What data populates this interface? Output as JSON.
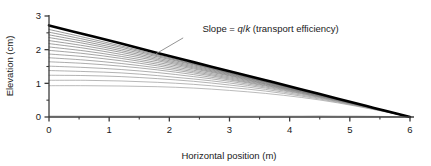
{
  "chart_data": {
    "type": "line",
    "title": "",
    "xlabel": "Horizontal position (m)",
    "ylabel": "Elevation (cm)",
    "xlim": [
      0,
      6
    ],
    "ylim": [
      0,
      3
    ],
    "xticks": [
      0,
      1,
      2,
      3,
      4,
      5,
      6
    ],
    "xticklabels": [
      "0",
      "1",
      "2",
      "3",
      "4",
      "5",
      "6"
    ],
    "yticks": [
      0,
      1,
      2,
      3
    ],
    "yticklabels": [
      "0",
      "1",
      "2",
      "3"
    ],
    "minor_ticks": true,
    "grid": false,
    "legend": "none",
    "annotations": [
      {
        "text_parts": [
          "Slope = ",
          "q",
          "/",
          "k",
          " (transport efficiency)"
        ],
        "italic_parts": [
          false,
          true,
          false,
          true,
          false
        ],
        "text": "Slope = q/k (transport efficiency)",
        "x": 2.55,
        "y": 2.53,
        "leader_from": [
          2.23,
          2.35
        ],
        "leader_to": [
          1.78,
          1.88
        ]
      }
    ],
    "series": [
      {
        "name": "steady-state profile",
        "color": "#000000",
        "linewidth": 2.6,
        "x": [
          0,
          0.6,
          1.2,
          1.8,
          2.4,
          3.0,
          3.6,
          4.2,
          4.8,
          5.4,
          6.0
        ],
        "values": [
          2.72,
          2.45,
          2.18,
          1.9,
          1.63,
          1.36,
          1.09,
          0.82,
          0.54,
          0.27,
          0.0
        ]
      },
      {
        "name": "profile t20",
        "color": "#6e6e6e",
        "linewidth": 0.7,
        "x": [
          0,
          0.6,
          1.2,
          1.8,
          2.4,
          3.0,
          3.6,
          4.2,
          4.8,
          5.4,
          6.0
        ],
        "values": [
          2.6,
          2.36,
          2.11,
          1.85,
          1.59,
          1.33,
          1.07,
          0.81,
          0.54,
          0.27,
          0.0
        ]
      },
      {
        "name": "profile t19",
        "color": "#6e6e6e",
        "linewidth": 0.7,
        "x": [
          0,
          0.6,
          1.2,
          1.8,
          2.4,
          3.0,
          3.6,
          4.2,
          4.8,
          5.4,
          6.0
        ],
        "values": [
          2.52,
          2.3,
          2.07,
          1.82,
          1.57,
          1.31,
          1.06,
          0.8,
          0.53,
          0.27,
          0.0
        ]
      },
      {
        "name": "profile t18",
        "color": "#707070",
        "linewidth": 0.7,
        "x": [
          0,
          0.6,
          1.2,
          1.8,
          2.4,
          3.0,
          3.6,
          4.2,
          4.8,
          5.4,
          6.0
        ],
        "values": [
          2.44,
          2.24,
          2.02,
          1.79,
          1.55,
          1.3,
          1.05,
          0.79,
          0.53,
          0.26,
          0.0
        ]
      },
      {
        "name": "profile t17",
        "color": "#737373",
        "linewidth": 0.7,
        "x": [
          0,
          0.6,
          1.2,
          1.8,
          2.4,
          3.0,
          3.6,
          4.2,
          4.8,
          5.4,
          6.0
        ],
        "values": [
          2.36,
          2.18,
          1.97,
          1.75,
          1.52,
          1.28,
          1.04,
          0.79,
          0.53,
          0.26,
          0.0
        ]
      },
      {
        "name": "profile t16",
        "color": "#757575",
        "linewidth": 0.7,
        "x": [
          0,
          0.6,
          1.2,
          1.8,
          2.4,
          3.0,
          3.6,
          4.2,
          4.8,
          5.4,
          6.0
        ],
        "values": [
          2.27,
          2.11,
          1.92,
          1.71,
          1.49,
          1.26,
          1.03,
          0.78,
          0.52,
          0.26,
          0.0
        ]
      },
      {
        "name": "profile t15",
        "color": "#787878",
        "linewidth": 0.7,
        "x": [
          0,
          0.6,
          1.2,
          1.8,
          2.4,
          3.0,
          3.6,
          4.2,
          4.8,
          5.4,
          6.0
        ],
        "values": [
          2.18,
          2.04,
          1.86,
          1.67,
          1.46,
          1.24,
          1.01,
          0.77,
          0.52,
          0.26,
          0.0
        ]
      },
      {
        "name": "profile t14",
        "color": "#7b7b7b",
        "linewidth": 0.7,
        "x": [
          0,
          0.6,
          1.2,
          1.8,
          2.4,
          3.0,
          3.6,
          4.2,
          4.8,
          5.4,
          6.0
        ],
        "values": [
          2.08,
          1.96,
          1.8,
          1.62,
          1.43,
          1.22,
          0.99,
          0.76,
          0.51,
          0.26,
          0.0
        ]
      },
      {
        "name": "profile t13",
        "color": "#7e7e7e",
        "linewidth": 0.7,
        "x": [
          0,
          0.6,
          1.2,
          1.8,
          2.4,
          3.0,
          3.6,
          4.2,
          4.8,
          5.4,
          6.0
        ],
        "values": [
          1.98,
          1.88,
          1.74,
          1.57,
          1.39,
          1.19,
          0.98,
          0.75,
          0.51,
          0.26,
          0.0
        ]
      },
      {
        "name": "profile t12",
        "color": "#818181",
        "linewidth": 0.7,
        "x": [
          0,
          0.6,
          1.2,
          1.8,
          2.4,
          3.0,
          3.6,
          4.2,
          4.8,
          5.4,
          6.0
        ],
        "values": [
          1.87,
          1.79,
          1.67,
          1.52,
          1.35,
          1.16,
          0.96,
          0.74,
          0.5,
          0.26,
          0.0
        ]
      },
      {
        "name": "profile t11",
        "color": "#858585",
        "linewidth": 0.7,
        "x": [
          0,
          0.6,
          1.2,
          1.8,
          2.4,
          3.0,
          3.6,
          4.2,
          4.8,
          5.4,
          6.0
        ],
        "values": [
          1.76,
          1.69,
          1.59,
          1.46,
          1.31,
          1.13,
          0.94,
          0.73,
          0.5,
          0.25,
          0.0
        ]
      },
      {
        "name": "profile t10",
        "color": "#888888",
        "linewidth": 0.7,
        "x": [
          0,
          0.6,
          1.2,
          1.8,
          2.4,
          3.0,
          3.6,
          4.2,
          4.8,
          5.4,
          6.0
        ],
        "values": [
          1.64,
          1.59,
          1.51,
          1.4,
          1.26,
          1.1,
          0.92,
          0.71,
          0.49,
          0.25,
          0.0
        ]
      },
      {
        "name": "profile t9",
        "color": "#8c8c8c",
        "linewidth": 0.7,
        "x": [
          0,
          0.6,
          1.2,
          1.8,
          2.4,
          3.0,
          3.6,
          4.2,
          4.8,
          5.4,
          6.0
        ],
        "values": [
          1.51,
          1.47,
          1.41,
          1.32,
          1.2,
          1.06,
          0.89,
          0.7,
          0.48,
          0.25,
          0.0
        ]
      },
      {
        "name": "profile t8",
        "color": "#909090",
        "linewidth": 0.7,
        "x": [
          0,
          0.6,
          1.2,
          1.8,
          2.4,
          3.0,
          3.6,
          4.2,
          4.8,
          5.4,
          6.0
        ],
        "values": [
          1.38,
          1.35,
          1.31,
          1.23,
          1.13,
          1.01,
          0.86,
          0.68,
          0.47,
          0.24,
          0.0
        ]
      },
      {
        "name": "profile t7",
        "color": "#949494",
        "linewidth": 0.7,
        "x": [
          0,
          0.6,
          1.2,
          1.8,
          2.4,
          3.0,
          3.6,
          4.2,
          4.8,
          5.4,
          6.0
        ],
        "values": [
          1.24,
          1.23,
          1.2,
          1.14,
          1.06,
          0.95,
          0.82,
          0.65,
          0.46,
          0.24,
          0.0
        ]
      },
      {
        "name": "profile t6",
        "color": "#989898",
        "linewidth": 0.7,
        "x": [
          0,
          0.6,
          1.2,
          1.8,
          2.4,
          3.0,
          3.6,
          4.2,
          4.8,
          5.4,
          6.0
        ],
        "values": [
          1.09,
          1.09,
          1.07,
          1.03,
          0.97,
          0.88,
          0.77,
          0.62,
          0.44,
          0.23,
          0.0
        ]
      },
      {
        "name": "profile t5",
        "color": "#9d9d9d",
        "linewidth": 0.7,
        "x": [
          0,
          0.6,
          1.2,
          1.8,
          2.4,
          3.0,
          3.6,
          4.2,
          4.8,
          5.4,
          6.0
        ],
        "values": [
          0.93,
          0.93,
          0.92,
          0.9,
          0.86,
          0.79,
          0.7,
          0.58,
          0.42,
          0.22,
          0.0
        ]
      },
      {
        "name": "initial flat profile",
        "color": "#c4c4c4",
        "linewidth": 1.2,
        "x": [
          0,
          0.6,
          1.2,
          1.8,
          2.4,
          3.0,
          3.6,
          4.2,
          4.8,
          5.4,
          6.0
        ],
        "values": [
          0.03,
          0.03,
          0.03,
          0.03,
          0.03,
          0.03,
          0.03,
          0.03,
          0.03,
          0.02,
          0.0
        ]
      }
    ]
  },
  "colors": {
    "axis": "#3c3c3c",
    "text": "#1a1a1a",
    "steady_state": "#000000",
    "leader": "#888888"
  }
}
